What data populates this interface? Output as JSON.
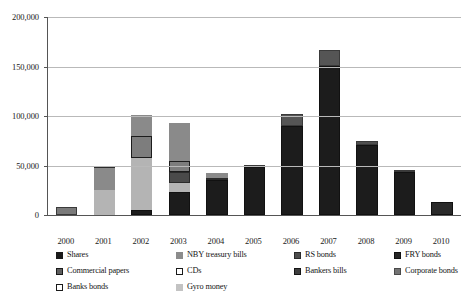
{
  "chart_data": {
    "type": "bar",
    "subtype": "stacked-bar",
    "title": "",
    "xlabel": "",
    "ylabel": "",
    "ylim": [
      0,
      200000
    ],
    "ytick_labels": [
      "0",
      "50,000",
      "100,000",
      "150,000",
      "200,000"
    ],
    "ytick_values": [
      0,
      50000,
      100000,
      150000,
      200000
    ],
    "grid": true,
    "legend_position": "bottom",
    "categories": [
      "2000",
      "2001",
      "2002",
      "2003",
      "2004",
      "2005",
      "2006",
      "2007",
      "2008",
      "2009",
      "2010"
    ],
    "series": [
      {
        "name": "Shares",
        "color": "#1a1a1a",
        "values": [
          0,
          0,
          5000,
          23000,
          35000,
          49000,
          90000,
          151000,
          71000,
          43000,
          13000
        ]
      },
      {
        "name": "NBY treasury bills",
        "color": "#8c8c8c",
        "values": [
          0,
          0,
          0,
          0,
          0,
          0,
          0,
          0,
          0,
          0,
          0
        ]
      },
      {
        "name": "RS bonds",
        "color": "#4d4d4d",
        "values": [
          0,
          0,
          0,
          0,
          0,
          0,
          0,
          0,
          0,
          0,
          0
        ]
      },
      {
        "name": "FRY bonds",
        "color": "#262626",
        "values": [
          0,
          0,
          0,
          0,
          0,
          0,
          0,
          0,
          0,
          0,
          0
        ]
      },
      {
        "name": "Commercial papers",
        "color": "#5e5e5e",
        "values": [
          0,
          0,
          0,
          0,
          2500,
          0,
          0,
          0,
          0,
          0,
          0
        ]
      },
      {
        "name": "CDs",
        "color": "#7d7d7d",
        "values": [
          0,
          0,
          20000,
          20000,
          2500,
          0,
          0,
          0,
          0,
          0,
          0
        ]
      },
      {
        "name": "Bankers bills",
        "color": "#3d3d3d",
        "values": [
          0,
          0,
          0,
          12000,
          0,
          0,
          0,
          0,
          0,
          0,
          0
        ]
      },
      {
        "name": "Corporate bonds",
        "color": "#737373",
        "values": [
          0,
          0,
          0,
          0,
          0,
          0,
          0,
          0,
          0,
          0,
          0
        ]
      },
      {
        "name": "Banks bonds",
        "color": "#6e6e6e",
        "values": [
          8000,
          25000,
          18000,
          28000,
          2000,
          1500,
          12000,
          16000,
          4000,
          2000,
          0
        ]
      },
      {
        "name": "Gyro money",
        "color": "#b0b0b0",
        "values": [
          0,
          25000,
          58000,
          10000,
          0,
          0,
          0,
          0,
          0,
          0,
          0
        ]
      }
    ],
    "totals": [
      8000,
      50000,
      101000,
      93000,
      42000,
      50500,
      102000,
      167000,
      75000,
      45000,
      13000
    ]
  },
  "axes": {
    "y_ticks": [
      {
        "label": "200,000",
        "value": 200000
      },
      {
        "label": "150,000",
        "value": 150000
      },
      {
        "label": "100,000",
        "value": 100000
      },
      {
        "label": "50,000",
        "value": 50000
      },
      {
        "label": "0",
        "value": 0
      }
    ],
    "x_ticks": [
      {
        "label": "2000"
      },
      {
        "label": "2001"
      },
      {
        "label": "2002"
      },
      {
        "label": "2003"
      },
      {
        "label": "2004"
      },
      {
        "label": "2005"
      },
      {
        "label": "2006"
      },
      {
        "label": "2007"
      },
      {
        "label": "2008"
      },
      {
        "label": "2009"
      },
      {
        "label": "2010"
      }
    ]
  },
  "legend": {
    "items": [
      {
        "label": "Shares",
        "color": "#1a1a1a",
        "border": "#1a1a1a"
      },
      {
        "label": "NBY treasury bills",
        "color": "#8c8c8c",
        "border": "#8c8c8c"
      },
      {
        "label": "RS bonds",
        "color": "#4d4d4d",
        "border": "#2a2a2a"
      },
      {
        "label": "FRY bonds",
        "color": "#262626",
        "border": "#111111"
      },
      {
        "label": "Commercial papers",
        "color": "#5e5e5e",
        "border": "#1a1a1a"
      },
      {
        "label": "CDs",
        "color": "#ffffff",
        "border": "#1a1a1a"
      },
      {
        "label": "Bankers bills",
        "color": "#3d3d3d",
        "border": "#151515"
      },
      {
        "label": "Corporate bonds",
        "color": "#737373",
        "border": "#4a4a4a"
      },
      {
        "label": "Banks bonds",
        "color": "#ffffff",
        "border": "#1a1a1a"
      },
      {
        "label": "Gyro money",
        "color": "#c3c3c3",
        "border": "#c3c3c3"
      }
    ]
  },
  "bars": [
    {
      "year": "2000",
      "total": 8000,
      "segments": [
        {
          "series": "Banks bonds",
          "value": 8000,
          "color": "#7a7a7a",
          "border": "#3a3a3a"
        }
      ]
    },
    {
      "year": "2001",
      "total": 50000,
      "segments": [
        {
          "series": "Gyro money",
          "value": 25000,
          "color": "#b4b4b4",
          "border": "#b4b4b4"
        },
        {
          "series": "Banks bonds",
          "value": 22000,
          "color": "#8a8a8a",
          "border": "#8a8a8a"
        },
        {
          "series": "Corporate bonds",
          "value": 3000,
          "color": "#5a5a5a",
          "border": "#2b2b2b"
        }
      ]
    },
    {
      "year": "2002",
      "total": 101000,
      "segments": [
        {
          "series": "Shares",
          "value": 5000,
          "color": "#1c1c1c",
          "border": "#111111"
        },
        {
          "series": "Gyro money",
          "value": 53000,
          "color": "#b4b4b4",
          "border": "#b4b4b4"
        },
        {
          "series": "CDs",
          "value": 22000,
          "color": "#7d7d7d",
          "border": "#1c1c1c"
        },
        {
          "series": "Banks bonds",
          "value": 21000,
          "color": "#8a8a8a",
          "border": "#8a8a8a"
        }
      ]
    },
    {
      "year": "2003",
      "total": 93000,
      "segments": [
        {
          "series": "Shares",
          "value": 23000,
          "color": "#1c1c1c",
          "border": "#111111"
        },
        {
          "series": "Gyro money",
          "value": 9000,
          "color": "#b4b4b4",
          "border": "#b4b4b4"
        },
        {
          "series": "Bankers bills",
          "value": 11000,
          "color": "#4a4a4a",
          "border": "#2a2a2a"
        },
        {
          "series": "CDs",
          "value": 12000,
          "color": "#7d7d7d",
          "border": "#1c1c1c"
        },
        {
          "series": "Banks bonds",
          "value": 38000,
          "color": "#8a8a8a",
          "border": "#8a8a8a"
        }
      ]
    },
    {
      "year": "2004",
      "total": 42000,
      "segments": [
        {
          "series": "Shares",
          "value": 35000,
          "color": "#1c1c1c",
          "border": "#111111"
        },
        {
          "series": "Commercial papers",
          "value": 2500,
          "color": "#666666",
          "border": "#2a2a2a"
        },
        {
          "series": "Banks bonds",
          "value": 4500,
          "color": "#8a8a8a",
          "border": "#8a8a8a"
        }
      ]
    },
    {
      "year": "2005",
      "total": 50500,
      "segments": [
        {
          "series": "Shares",
          "value": 48500,
          "color": "#1c1c1c",
          "border": "#111111"
        },
        {
          "series": "Banks bonds",
          "value": 2000,
          "color": "#5a5a5a",
          "border": "#3a3a3a"
        }
      ]
    },
    {
      "year": "2006",
      "total": 102000,
      "segments": [
        {
          "series": "Shares",
          "value": 90000,
          "color": "#1c1c1c",
          "border": "#111111"
        },
        {
          "series": "Banks bonds",
          "value": 12000,
          "color": "#555555",
          "border": "#3a3a3a"
        }
      ]
    },
    {
      "year": "2007",
      "total": 167000,
      "segments": [
        {
          "series": "Shares",
          "value": 151000,
          "color": "#1c1c1c",
          "border": "#111111"
        },
        {
          "series": "Banks bonds",
          "value": 16000,
          "color": "#555555",
          "border": "#3a3a3a"
        }
      ]
    },
    {
      "year": "2008",
      "total": 75000,
      "segments": [
        {
          "series": "Shares",
          "value": 71000,
          "color": "#1c1c1c",
          "border": "#111111"
        },
        {
          "series": "Banks bonds",
          "value": 4000,
          "color": "#4f4f4f",
          "border": "#3a3a3a"
        }
      ]
    },
    {
      "year": "2009",
      "total": 45000,
      "segments": [
        {
          "series": "Shares",
          "value": 43000,
          "color": "#1c1c1c",
          "border": "#111111"
        },
        {
          "series": "Banks bonds",
          "value": 2000,
          "color": "#4f4f4f",
          "border": "#3a3a3a"
        }
      ]
    },
    {
      "year": "2010",
      "total": 13000,
      "segments": [
        {
          "series": "Shares",
          "value": 13000,
          "color": "#2a2a2a",
          "border": "#111111"
        }
      ]
    }
  ]
}
